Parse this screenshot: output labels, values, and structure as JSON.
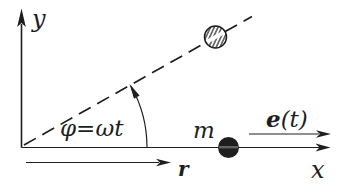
{
  "figure": {
    "background_color": "#ffffff",
    "ink_color": "#1e1e1e",
    "labels": {
      "y_axis": "y",
      "x_axis": "x",
      "angle": "φ=ωt",
      "mass": "m",
      "unit_vector_symbol": "e",
      "unit_vector_argument": "(t)",
      "position_vector": "r"
    }
  }
}
